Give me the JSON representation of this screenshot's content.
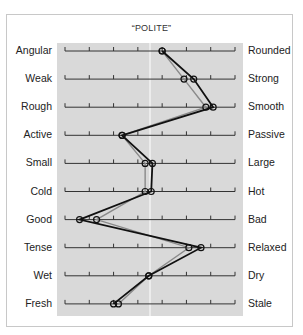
{
  "chart_data": {
    "type": "line",
    "subtype": "semantic-differential-profile",
    "title": "“POLITE”",
    "orientation": "horizontal scales, one row per adjective pair",
    "scale": {
      "ticks": 8,
      "min": 1,
      "max": 8,
      "midpoint": 4.5,
      "midline": true
    },
    "pairs": [
      {
        "left": "Angular",
        "right": "Rounded"
      },
      {
        "left": "Weak",
        "right": "Strong"
      },
      {
        "left": "Rough",
        "right": "Smooth"
      },
      {
        "left": "Active",
        "right": "Passive"
      },
      {
        "left": "Small",
        "right": "Large"
      },
      {
        "left": "Cold",
        "right": "Hot"
      },
      {
        "left": "Good",
        "right": "Bad"
      },
      {
        "left": "Tense",
        "right": "Relaxed"
      },
      {
        "left": "Wet",
        "right": "Dry"
      },
      {
        "left": "Fresh",
        "right": "Stale"
      }
    ],
    "series": [
      {
        "name": "Profile A (black)",
        "color": "#111111",
        "values": [
          5.0,
          6.3,
          7.1,
          3.35,
          4.6,
          4.55,
          1.6,
          6.6,
          4.45,
          3.0
        ]
      },
      {
        "name": "Profile B (gray)",
        "color": "#8a8a8a",
        "values": [
          5.0,
          5.9,
          6.8,
          3.35,
          4.3,
          4.3,
          2.3,
          6.1,
          4.45,
          3.2
        ]
      }
    ],
    "legend": null,
    "grid": false
  },
  "colors": {
    "panel": "#d9d9d9",
    "midline": "#ffffff",
    "axis": "#333333"
  }
}
